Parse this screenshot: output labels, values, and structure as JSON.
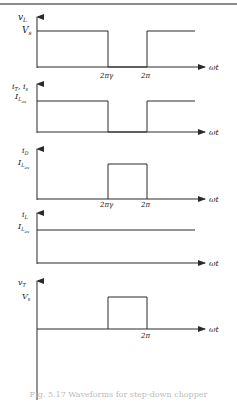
{
  "figure": {
    "caption": "Fig. 5.17 Waveforms for step-down chopper",
    "colors": {
      "line": "#2a2a2a",
      "rule": "#555555",
      "background": "#ffffff"
    },
    "x_axis_label": "ωt",
    "tick_labels": {
      "two_pi_gamma": "2πγ",
      "two_pi": "2π"
    },
    "panels": [
      {
        "id": "vL",
        "ylabel_main": "v",
        "ylabel_sub": "L",
        "level_main": "V",
        "level_sub": "s",
        "waveform": "high 0→2πγ, low 2πγ→2π, high after 2π",
        "ticks": [
          "2πγ",
          "2π"
        ]
      },
      {
        "id": "iT",
        "ylabel_main": "i",
        "ylabel_sub": "T",
        "ylabel_extra_main": ", i",
        "ylabel_extra_sub": "s",
        "level_main": "I",
        "level_sub": "L",
        "level_subsub": "av",
        "waveform": "high 0→2πγ, low 2πγ→2π, high after 2π",
        "ticks": []
      },
      {
        "id": "iD",
        "ylabel_main": "i",
        "ylabel_sub": "D",
        "level_main": "I",
        "level_sub": "L",
        "level_subsub": "av",
        "waveform": "pulse 2πγ→2π",
        "ticks": [
          "2πγ",
          "2π"
        ]
      },
      {
        "id": "iL",
        "ylabel_main": "i",
        "ylabel_sub": "L",
        "level_main": "I",
        "level_sub": "L",
        "level_subsub": "av",
        "waveform": "constant",
        "ticks": []
      },
      {
        "id": "vT",
        "ylabel_main": "v",
        "ylabel_sub": "T",
        "level_main": "V",
        "level_sub": "s",
        "waveform": "pulse 2πγ→2π",
        "ticks": [
          "2π"
        ]
      }
    ]
  }
}
